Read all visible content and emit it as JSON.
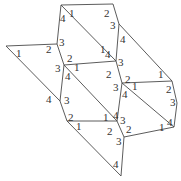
{
  "diagram": {
    "type": "labeled-angle-polygon-net",
    "vertices": [
      "A",
      "B",
      "C",
      "D",
      "E",
      "F",
      "G",
      "H",
      "I",
      "J",
      "K",
      "L",
      "M",
      "N",
      "O",
      "P"
    ],
    "edges": [
      [
        "A",
        "B"
      ],
      [
        "B",
        "C"
      ],
      [
        "A",
        "D"
      ],
      [
        "A",
        "G"
      ],
      [
        "C",
        "G"
      ],
      [
        "C",
        "I"
      ],
      [
        "E",
        "D"
      ],
      [
        "D",
        "F"
      ],
      [
        "E",
        "P"
      ],
      [
        "F",
        "G"
      ],
      [
        "F",
        "M"
      ],
      [
        "F",
        "P"
      ],
      [
        "G",
        "H"
      ],
      [
        "H",
        "I"
      ],
      [
        "H",
        "K"
      ],
      [
        "H",
        "M"
      ],
      [
        "I",
        "J"
      ],
      [
        "J",
        "K"
      ],
      [
        "P",
        "L"
      ],
      [
        "L",
        "M"
      ],
      [
        "L",
        "O"
      ],
      [
        "M",
        "N"
      ],
      [
        "N",
        "K"
      ],
      [
        "N",
        "O"
      ]
    ],
    "angle_labels": [
      {
        "vertex": "A",
        "text": "4"
      },
      {
        "vertex": "A",
        "text": "1"
      },
      {
        "vertex": "B",
        "text": "2"
      },
      {
        "vertex": "C",
        "text": "3"
      },
      {
        "vertex": "C",
        "text": "4"
      },
      {
        "vertex": "D",
        "text": "3"
      },
      {
        "vertex": "D",
        "text": "2"
      },
      {
        "vertex": "E",
        "text": "1"
      },
      {
        "vertex": "F",
        "text": "2"
      },
      {
        "vertex": "F",
        "text": "3"
      },
      {
        "vertex": "F",
        "text": "1"
      },
      {
        "vertex": "F",
        "text": "4"
      },
      {
        "vertex": "G",
        "text": "4"
      },
      {
        "vertex": "G",
        "text": "1"
      },
      {
        "vertex": "G",
        "text": "3"
      },
      {
        "vertex": "G",
        "text": "2"
      },
      {
        "vertex": "H",
        "text": "2"
      },
      {
        "vertex": "H",
        "text": "3"
      },
      {
        "vertex": "H",
        "text": "1"
      },
      {
        "vertex": "H",
        "text": "4"
      },
      {
        "vertex": "I",
        "text": "1"
      },
      {
        "vertex": "I",
        "text": "2"
      },
      {
        "vertex": "J",
        "text": "3"
      },
      {
        "vertex": "K",
        "text": "4"
      },
      {
        "vertex": "K",
        "text": "1"
      },
      {
        "vertex": "P",
        "text": "4"
      },
      {
        "vertex": "P",
        "text": "3"
      },
      {
        "vertex": "L",
        "text": "2"
      },
      {
        "vertex": "L",
        "text": "1"
      },
      {
        "vertex": "M",
        "text": "1"
      },
      {
        "vertex": "M",
        "text": "4"
      },
      {
        "vertex": "M",
        "text": "3"
      },
      {
        "vertex": "M",
        "text": "2"
      },
      {
        "vertex": "N",
        "text": "2"
      },
      {
        "vertex": "N",
        "text": "3"
      },
      {
        "vertex": "O",
        "text": "4"
      }
    ]
  }
}
